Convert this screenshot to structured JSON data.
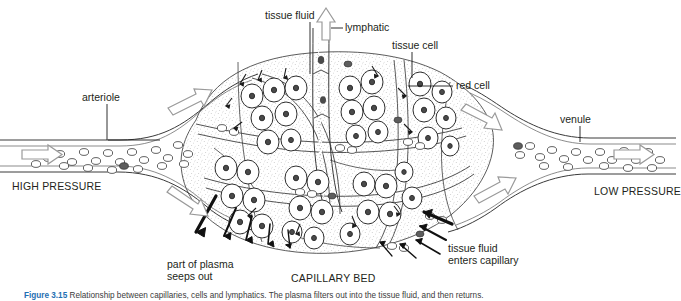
{
  "figure": {
    "background": "#ffffff",
    "ink": "#231f20",
    "caption_number": "Figure 3.15",
    "caption_text": "Relationship between capillaries, cells and lymphatics. The plasma filters out into the tissue fluid, and then returns.",
    "caption_accent": "#1f6fb2"
  },
  "labels": {
    "tissue_fluid_top": "tissue fluid",
    "lymphatic": "lymphatic",
    "tissue_cell": "tissue cell",
    "red_cell": "red cell",
    "arteriole": "arteriole",
    "venule": "venule",
    "high_pressure": "HIGH PRESSURE",
    "low_pressure": "LOW PRESSURE",
    "capillary_bed": "CAPILLARY BED",
    "plasma_line1": "part of plasma",
    "plasma_line2": "seeps out",
    "enters_line1": "tissue fluid",
    "enters_line2": "enters capillary"
  },
  "icons": {
    "flow_arrow": "hollow-flow-arrow",
    "lymph_arrow": "hollow-up-arrow",
    "seep_arrow": "solid-arrow",
    "leader": "leader-line"
  }
}
